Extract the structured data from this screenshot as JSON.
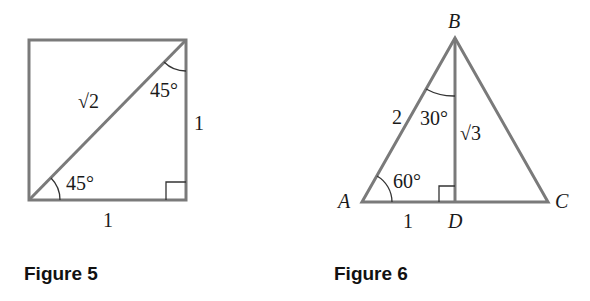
{
  "figure5": {
    "caption": "Figure 5",
    "diagonal_label": "√2",
    "angle_top": "45°",
    "angle_bottom": "45°",
    "side_right": "1",
    "side_bottom": "1"
  },
  "figure6": {
    "caption": "Figure 6",
    "vertex_a": "A",
    "vertex_b": "B",
    "vertex_c": "C",
    "vertex_d": "D",
    "side_ab": "2",
    "side_ad": "1",
    "side_bd": "√3",
    "angle_b": "30°",
    "angle_a": "60°"
  },
  "colors": {
    "line": "#7a7a7a",
    "text": "#1a1a1a"
  }
}
